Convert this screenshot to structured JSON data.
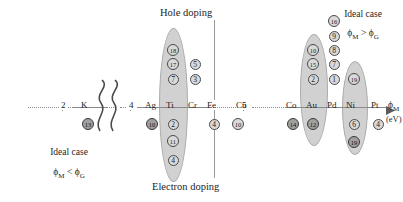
{
  "figure": {
    "type": "annotated-number-line",
    "axis_label_main": "ϕ",
    "axis_label_sub": "M",
    "axis_label_unit": "(eV)",
    "section_top": "Hole doping",
    "section_bottom": "Electron doping",
    "axis_ticks": [
      {
        "label": "2",
        "x": 62
      },
      {
        "label": "4",
        "x": 130
      },
      {
        "label": "5",
        "x": 243
      }
    ],
    "break_symbol": "squiggle-axis-break"
  },
  "notes": {
    "left": {
      "line1": "Ideal case",
      "line2_lhs": "ϕ",
      "line2_lhs_sub": "M",
      "line2_op": "<",
      "line2_rhs": "ϕ",
      "line2_rhs_sub": "G"
    },
    "right": {
      "line1": "Ideal case",
      "line2_lhs": "ϕ",
      "line2_lhs_sub": "M",
      "line2_op": ">",
      "line2_rhs": "ϕ",
      "line2_rhs_sub": "G"
    }
  },
  "elements": [
    {
      "symbol": "K",
      "x": 88
    },
    {
      "symbol": "Ag",
      "x": 152
    },
    {
      "symbol": "Ti",
      "x": 173
    },
    {
      "symbol": "Cr",
      "x": 195
    },
    {
      "symbol": "Fe",
      "x": 214
    },
    {
      "symbol": "Cu",
      "x": 243
    },
    {
      "symbol": "Co",
      "x": 293
    },
    {
      "symbol": "Au",
      "x": 313
    },
    {
      "symbol": "Pd",
      "x": 334
    },
    {
      "symbol": "Ni",
      "x": 353
    },
    {
      "symbol": "Pt",
      "x": 378
    }
  ],
  "blobs": [
    {
      "name": "ti-blob",
      "left": 159,
      "top": 28,
      "width": 27,
      "height": 152
    },
    {
      "name": "au-blob",
      "left": 300,
      "top": 34,
      "width": 26,
      "height": 110
    },
    {
      "name": "ni-blob",
      "left": 342,
      "top": 61,
      "width": 24,
      "height": 92
    }
  ],
  "data_points_above": [
    {
      "element": "Ti",
      "value": "18",
      "cx": 173,
      "cy": 50
    },
    {
      "element": "Ti",
      "value": "17",
      "cx": 173,
      "cy": 64
    },
    {
      "element": "Ti",
      "value": "7",
      "cx": 173,
      "cy": 79
    },
    {
      "element": "Cr",
      "value": "5",
      "cx": 195,
      "cy": 64
    },
    {
      "element": "Cr",
      "value": "3",
      "cx": 195,
      "cy": 79
    },
    {
      "element": "Au",
      "value": "10",
      "cx": 313,
      "cy": 50
    },
    {
      "element": "Au",
      "value": "15",
      "cx": 313,
      "cy": 64
    },
    {
      "element": "Au",
      "value": "2",
      "cx": 313,
      "cy": 79
    },
    {
      "element": "Pd",
      "value": "16",
      "cx": 334,
      "cy": 21
    },
    {
      "element": "Pd",
      "value": "9",
      "cx": 334,
      "cy": 36
    },
    {
      "element": "Pd",
      "value": "8",
      "cx": 334,
      "cy": 50
    },
    {
      "element": "Pd",
      "value": "7",
      "cx": 334,
      "cy": 64
    },
    {
      "element": "Pd",
      "value": "1",
      "cx": 334,
      "cy": 79
    },
    {
      "element": "Ni",
      "value": "19",
      "cx": 354,
      "cy": 79
    }
  ],
  "data_points_below": [
    {
      "element": "K",
      "value": "13",
      "cx": 88,
      "cy": 124,
      "shade": "dark"
    },
    {
      "element": "Ag",
      "value": "10",
      "cx": 152,
      "cy": 124,
      "shade": "dark"
    },
    {
      "element": "Ti",
      "value": "2",
      "cx": 173,
      "cy": 124,
      "shade": "light"
    },
    {
      "element": "Ti",
      "value": "11",
      "cx": 173,
      "cy": 141,
      "shade": "light"
    },
    {
      "element": "Ti",
      "value": "4",
      "cx": 173,
      "cy": 160,
      "shade": "light"
    },
    {
      "element": "Fe",
      "value": "4",
      "cx": 214,
      "cy": 124,
      "shade": "light"
    },
    {
      "element": "Cu",
      "value": "10",
      "cx": 238,
      "cy": 124,
      "shade": "light"
    },
    {
      "element": "Co",
      "value": "14",
      "cx": 293,
      "cy": 124,
      "shade": "dark"
    },
    {
      "element": "Au",
      "value": "12",
      "cx": 313,
      "cy": 124,
      "shade": "dark"
    },
    {
      "element": "Ni",
      "value": "6",
      "cx": 354,
      "cy": 124,
      "shade": "light"
    },
    {
      "element": "Ni",
      "value": "19",
      "cx": 354,
      "cy": 142,
      "shade": "dark"
    },
    {
      "element": "Pt",
      "value": "4",
      "cx": 378,
      "cy": 124,
      "shade": "light"
    }
  ],
  "colors": {
    "blob_fill": "#c9c9c9",
    "axis": "#8a8a8a",
    "text": "#1d1d1d"
  }
}
